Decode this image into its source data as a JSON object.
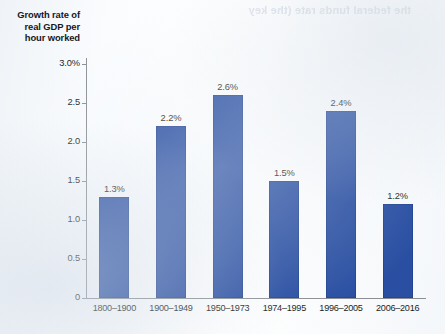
{
  "page": {
    "bleed_through_text": "the federal funds rate (the key"
  },
  "chart_data": {
    "type": "bar",
    "title": "",
    "xlabel": "",
    "ylabel": "Growth rate of real GDP per hour worked",
    "ylabel_lines": [
      "Growth rate of",
      "real GDP per",
      "hour worked"
    ],
    "categories": [
      "1800–1900",
      "1900–1949",
      "1950–1973",
      "1974–1995",
      "1996–2005",
      "2006–2016"
    ],
    "values": [
      1.3,
      2.2,
      2.6,
      1.5,
      2.4,
      1.2
    ],
    "value_labels": [
      "1.3%",
      "2.2%",
      "2.6%",
      "1.5%",
      "2.4%",
      "1.2%"
    ],
    "ylim": [
      0,
      3.0
    ],
    "ytick_values": [
      3.0,
      2.5,
      2.0,
      1.5,
      1.0,
      0.5,
      0
    ],
    "ytick_labels": [
      "3.0%",
      "2.5",
      "2.0",
      "1.5",
      "1.0",
      "0.5",
      "0"
    ],
    "grid": false,
    "legend": null,
    "bar_color": "#2a4fa2",
    "axis_color": "#8b8f94",
    "text_color": "#1b1e22"
  }
}
